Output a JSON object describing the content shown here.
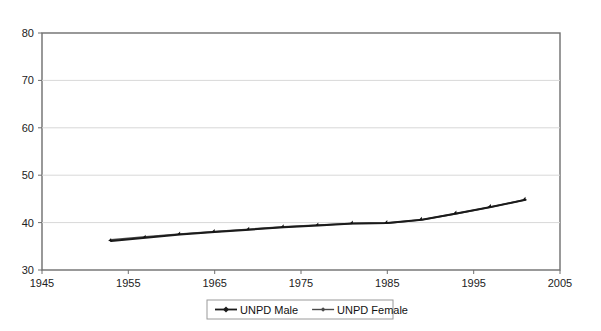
{
  "chart_data": {
    "type": "line",
    "title": "",
    "subtitle": "",
    "xlabel": "",
    "ylabel": "",
    "xlim": [
      1945,
      2005
    ],
    "ylim": [
      30,
      80
    ],
    "xticks": [
      1945,
      1955,
      1965,
      1975,
      1985,
      1995,
      2005
    ],
    "yticks": [
      30,
      40,
      50,
      60,
      70,
      80
    ],
    "xtick_labels": [
      "1945",
      "1955",
      "1965",
      "1975",
      "1985",
      "1995",
      "2005"
    ],
    "ytick_labels": [
      "30",
      "40",
      "50",
      "60",
      "70",
      "80"
    ],
    "grid": "horizontal",
    "legend_position": "bottom-center",
    "x": [
      1953,
      1957,
      1961,
      1965,
      1969,
      1973,
      1977,
      1981,
      1985,
      1989,
      1993,
      1997,
      2001
    ],
    "series": [
      {
        "name": "UNPD Male",
        "marker": "diamond",
        "color": "#1b1b1b",
        "values": [
          36.1,
          36.8,
          37.5,
          38.0,
          38.5,
          39.0,
          39.4,
          39.8,
          39.9,
          40.6,
          41.9,
          43.3,
          44.8
        ]
      },
      {
        "name": "UNPD Female",
        "marker": "diamond-small",
        "color": "#4a4a4a",
        "values": [
          36.4,
          37.0,
          37.6,
          38.1,
          38.6,
          39.1,
          39.5,
          39.8,
          39.9,
          40.6,
          41.9,
          43.3,
          44.8
        ]
      }
    ]
  },
  "legend": {
    "items": [
      {
        "label": "UNPD Male"
      },
      {
        "label": "UNPD Female"
      }
    ]
  }
}
